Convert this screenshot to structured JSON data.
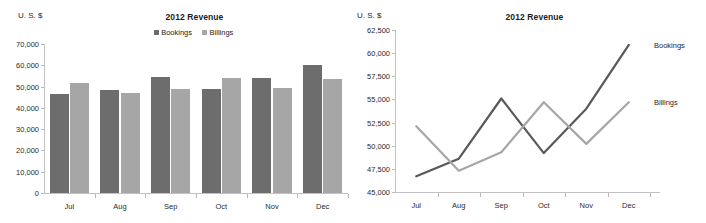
{
  "charts": {
    "bar": {
      "title": "2012 Revenue",
      "y_unit_label": "U. S. $",
      "legend": [
        {
          "label": "Bookings",
          "color": "#6d6d6d"
        },
        {
          "label": "Billings",
          "color": "#a6a6a6"
        }
      ]
    },
    "line": {
      "title": "2012 Revenue",
      "y_unit_label": "U. S. $",
      "labels": [
        {
          "label": "Bookings",
          "color": "#595959"
        },
        {
          "label": "Billings",
          "color": "#a6a6a6"
        }
      ]
    }
  },
  "chart_data": [
    {
      "type": "bar",
      "title": "2012 Revenue",
      "xlabel": "",
      "ylabel": "U. S. $",
      "categories": [
        "Jul",
        "Aug",
        "Sep",
        "Oct",
        "Nov",
        "Dec"
      ],
      "series": [
        {
          "name": "Bookings",
          "color": "#6d6d6d",
          "values": [
            46700,
            48600,
            54600,
            48700,
            54000,
            60000
          ]
        },
        {
          "name": "Billings",
          "color": "#a6a6a6",
          "values": [
            51600,
            46900,
            48900,
            54100,
            49400,
            53700
          ]
        }
      ],
      "ylim": [
        0,
        70000
      ],
      "yticks": [
        0,
        10000,
        20000,
        30000,
        40000,
        50000,
        60000,
        70000
      ],
      "ytick_labels": [
        "0",
        "10,000",
        "20,000",
        "30,000",
        "40,000",
        "50,000",
        "60,000",
        "70,000"
      ],
      "grid": false,
      "legend": "top-center"
    },
    {
      "type": "line",
      "title": "2012 Revenue",
      "xlabel": "",
      "ylabel": "U. S. $",
      "x": [
        "Jul",
        "Aug",
        "Sep",
        "Oct",
        "Nov",
        "Dec"
      ],
      "series": [
        {
          "name": "Bookings",
          "color": "#595959",
          "values": [
            46700,
            48600,
            55100,
            49200,
            54000,
            60900
          ]
        },
        {
          "name": "Billings",
          "color": "#a6a6a6",
          "values": [
            52100,
            47300,
            49300,
            54700,
            50200,
            54700
          ]
        }
      ],
      "ylim": [
        45000,
        62500
      ],
      "yticks": [
        45000,
        47500,
        50000,
        52500,
        55000,
        57500,
        60000,
        62500
      ],
      "ytick_labels": [
        "45,000",
        "47,500",
        "50,000",
        "52,500",
        "55,000",
        "57,500",
        "60,000",
        "62,500"
      ],
      "grid": false,
      "legend": "inline-end-of-line"
    }
  ]
}
